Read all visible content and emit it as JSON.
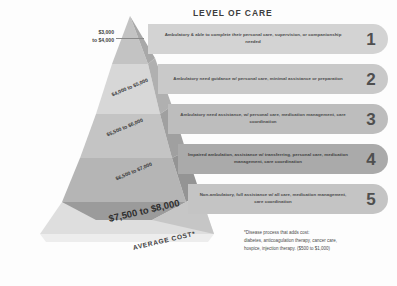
{
  "title": "LEVEL OF CARE",
  "average_cost_label": "AVERAGE COST*",
  "bottom_price": "$7,500 to $8,000",
  "left_callout": {
    "line1": "$3,000",
    "line2": "to $4,000"
  },
  "band_prices": [
    {
      "name": "band-2-price",
      "text": "$4,000 to $5,000"
    },
    {
      "name": "band-3-price",
      "text": "$5,500 to $6,000"
    },
    {
      "name": "band-4-price",
      "text": "$6,500 to $7,000"
    }
  ],
  "levels": [
    {
      "number": "1",
      "description": "Ambulatory & able to complete their personal care, supervision, or companionship needed",
      "color": "#d3d3d3"
    },
    {
      "number": "2",
      "description": "Ambulatory need guidance w/ personal care, minimal assistance or preparation",
      "color": "#c9c9c9"
    },
    {
      "number": "3",
      "description": "Ambulatory need assistance, w/ personal care, medication management, care coordination",
      "color": "#bdbdbd"
    },
    {
      "number": "4",
      "description": "Impaired ambulation, assistance w/ transferring, personal care, medication management, care coordination",
      "color": "#aaaaaa"
    },
    {
      "number": "5",
      "description": "Non-ambulatory, full assistance w/ all care, medication management, care coordination",
      "color": "#c4c4c4"
    }
  ],
  "footnote": {
    "line1": "*Disease process that adds cost:",
    "line2": "diabetes, anticoagulation therapy, cancer care,",
    "line3": "hospice, injection therapy. ($500 to $1,000)"
  },
  "colors": {
    "pyramid_light": "#d6d6d6",
    "pyramid_mid": "#c0c0c0",
    "pyramid_dark": "#9f9f9f",
    "background": "#fdfdfd",
    "text": "#3a3a3a"
  }
}
